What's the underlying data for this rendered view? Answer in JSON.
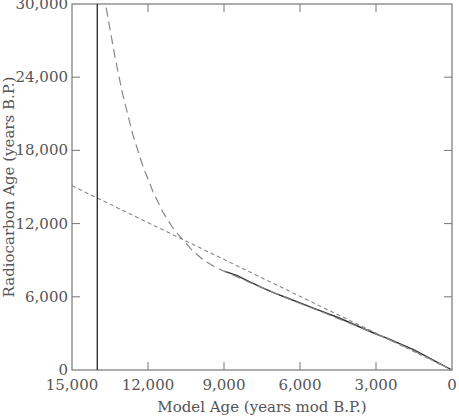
{
  "chart_data": {
    "type": "line",
    "title": "",
    "xlabel": "Model Age (years mod B.P.)",
    "ylabel": "Radiocarbon Age (years B.P.)",
    "xlim": [
      15000,
      0
    ],
    "ylim": [
      0,
      30000
    ],
    "x_reversed": true,
    "grid": false,
    "legend": null,
    "x_ticks": [
      15000,
      12000,
      9000,
      6000,
      3000,
      0
    ],
    "x_tick_labels": [
      "15,000",
      "12,000",
      "9,000",
      "6,000",
      "3,000",
      "0"
    ],
    "y_ticks": [
      0,
      6000,
      12000,
      18000,
      24000,
      30000
    ],
    "y_tick_labels": [
      "0",
      "6,000",
      "12,000",
      "18,000",
      "24,000",
      "30,000"
    ],
    "series": [
      {
        "name": "data (solid)",
        "style": "solid",
        "x": [
          9000,
          8500,
          8000,
          7500,
          7000,
          6500,
          6000,
          5500,
          5000,
          4500,
          4000,
          3500,
          3000,
          2500,
          2000,
          1500,
          1000,
          500,
          0
        ],
        "y": [
          8100,
          7750,
          7250,
          6750,
          6300,
          5900,
          5500,
          5100,
          4700,
          4300,
          3850,
          3400,
          2950,
          2550,
          2100,
          1650,
          1100,
          550,
          0
        ]
      },
      {
        "name": "model curve (long dash)",
        "style": "long-dash",
        "x": [
          13650,
          13300,
          13000,
          12600,
          12200,
          11800,
          11400,
          11000,
          10600,
          10200,
          9800,
          9400,
          9000,
          8000,
          7000,
          6000,
          5000,
          4000,
          3000,
          2000,
          1000,
          0
        ],
        "y": [
          29700,
          25600,
          22600,
          19300,
          16700,
          14600,
          12900,
          11600,
          10600,
          9700,
          9000,
          8500,
          8100,
          7200,
          6300,
          5450,
          4650,
          3800,
          2950,
          2050,
          1050,
          0
        ]
      },
      {
        "name": "linear reference (short dash)",
        "style": "short-dash",
        "x": [
          15000,
          0
        ],
        "y": [
          15100,
          0
        ]
      },
      {
        "name": "vertical limit (solid)",
        "style": "solid",
        "x": [
          14000,
          14000
        ],
        "y": [
          0,
          30000
        ]
      }
    ]
  }
}
